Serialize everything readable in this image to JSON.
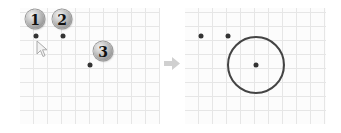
{
  "diagram": {
    "left_panel": {
      "markers": [
        {
          "label": "1",
          "dot_x": 36,
          "dot_y": 36,
          "badge_x": 35,
          "badge_y": 19
        },
        {
          "label": "2",
          "dot_x": 63,
          "dot_y": 36,
          "badge_x": 62,
          "badge_y": 19
        },
        {
          "label": "3",
          "dot_x": 90,
          "dot_y": 65,
          "badge_x": 103,
          "badge_y": 51
        }
      ],
      "cursor": {
        "icon": "mouse-pointer-icon",
        "x": 36,
        "y": 40
      }
    },
    "transition_arrow": {
      "icon": "arrow-right-icon",
      "color": "#cccccc"
    },
    "right_panel": {
      "points": [
        {
          "x": 201,
          "y": 36
        },
        {
          "x": 228,
          "y": 36
        },
        {
          "x": 256,
          "y": 65
        }
      ],
      "circle": {
        "cx": 256,
        "cy": 65,
        "r": 28,
        "stroke": "#444444"
      }
    },
    "colors": {
      "grid": "#e6e6e6",
      "dot": "#333333",
      "badge": "#a9a9a9"
    }
  }
}
